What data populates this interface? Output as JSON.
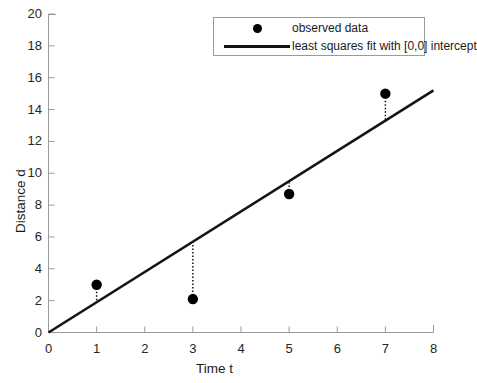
{
  "chart_data": {
    "type": "scatter",
    "title": "",
    "xlabel": "Time t",
    "ylabel": "Distance d",
    "xlim": [
      0,
      8
    ],
    "ylim": [
      0,
      20
    ],
    "xticks": [
      0,
      1,
      2,
      3,
      4,
      5,
      6,
      7,
      8
    ],
    "yticks": [
      0,
      2,
      4,
      6,
      8,
      10,
      12,
      14,
      16,
      18,
      20
    ],
    "xtick_labels": [
      "0",
      "1",
      "2",
      "3",
      "4",
      "5",
      "6",
      "7",
      "8"
    ],
    "ytick_labels": [
      "0",
      "2",
      "4",
      "6",
      "8",
      "10",
      "12",
      "14",
      "16",
      "18",
      "20"
    ],
    "grid": false,
    "legend_position": "upper right",
    "series": [
      {
        "name": "observed data",
        "type": "scatter",
        "marker": "circle",
        "color": "#000000",
        "x": [
          1,
          3,
          5,
          7
        ],
        "y": [
          3.0,
          2.1,
          8.7,
          15.0
        ]
      },
      {
        "name": "least squares fit with [0,0] intercept",
        "type": "line",
        "color": "#141414",
        "slope": 1.9,
        "intercept": 0,
        "x": [
          0,
          8
        ],
        "y": [
          0,
          15.2
        ]
      }
    ],
    "residual_lines": [
      {
        "x": 1,
        "y_data": 3.0,
        "y_fit": 1.9
      },
      {
        "x": 3,
        "y_data": 2.1,
        "y_fit": 5.7
      },
      {
        "x": 5,
        "y_data": 8.7,
        "y_fit": 9.5
      },
      {
        "x": 7,
        "y_data": 15.0,
        "y_fit": 13.3
      }
    ]
  },
  "legend": {
    "entries": [
      {
        "label": "observed data",
        "marker": "dot"
      },
      {
        "label": "least squares fit with [0,0] intercept",
        "marker": "line"
      }
    ]
  },
  "colors": {
    "axis": "#9a9a9a",
    "data_marker": "#000000",
    "fit_line": "#141414",
    "residual": "#000000",
    "background": "#ffffff"
  }
}
